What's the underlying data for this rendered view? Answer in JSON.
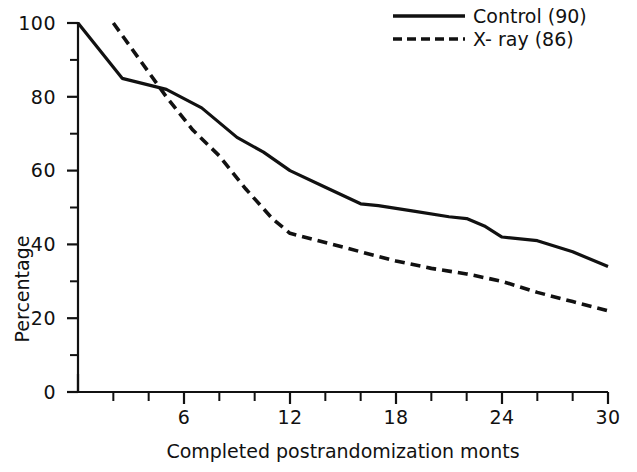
{
  "chart_data": {
    "type": "line",
    "title": "",
    "xlabel": "Completed postrandomization monts",
    "ylabel": "Percentage",
    "xlim": [
      0,
      30
    ],
    "ylim": [
      0,
      100
    ],
    "grid": false,
    "legend_position": "top-right",
    "x_ticks": [
      0,
      2,
      4,
      6,
      8,
      10,
      12,
      14,
      16,
      18,
      20,
      22,
      24,
      26,
      28,
      30
    ],
    "x_tick_labels": [
      "",
      "",
      "",
      "6",
      "",
      "",
      "12",
      "",
      "",
      "18",
      "",
      "",
      "24",
      "",
      "",
      "30"
    ],
    "x_major_ticks": [
      6,
      12,
      18,
      24,
      30
    ],
    "y_ticks": [
      0,
      10,
      20,
      30,
      40,
      50,
      60,
      70,
      80,
      90,
      100
    ],
    "y_tick_labels": [
      "0",
      "",
      "20",
      "",
      "40",
      "",
      "60",
      "",
      "80",
      "",
      "100"
    ],
    "y_major_ticks": [
      0,
      20,
      40,
      60,
      80,
      100
    ],
    "series": [
      {
        "name": "Control (90)",
        "style": "solid",
        "color": "#111111",
        "x": [
          0,
          2.5,
          5,
          7,
          9,
          10.5,
          12,
          14,
          16,
          17,
          19,
          21,
          22,
          23,
          24,
          26,
          28,
          30
        ],
        "values": [
          100,
          85,
          82,
          77,
          69,
          65,
          60,
          55.5,
          51,
          50.5,
          49,
          47.5,
          47,
          45,
          42,
          41,
          38,
          34
        ]
      },
      {
        "name": "X- ray (86)",
        "style": "dashed",
        "color": "#111111",
        "x": [
          2,
          3.5,
          5,
          6.5,
          8,
          9.5,
          11,
          12,
          14,
          16,
          18,
          20,
          22,
          24,
          26,
          28,
          30
        ],
        "values": [
          100,
          90,
          80,
          71,
          64,
          55,
          47,
          43,
          40.5,
          38,
          35.5,
          33.5,
          32,
          30,
          27,
          24.5,
          22
        ]
      }
    ]
  },
  "legend": {
    "items": [
      {
        "label": "Control (90)",
        "style": "solid"
      },
      {
        "label": "X- ray (86)",
        "style": "dashed"
      }
    ]
  },
  "axes": {
    "y_title": "Percentage",
    "x_title": "Completed postrandomization monts",
    "y_labels": [
      "100",
      "80",
      "60",
      "40",
      "20",
      "0"
    ],
    "x_labels": [
      "6",
      "12",
      "18",
      "24",
      "30"
    ]
  },
  "footer": {
    "cut_off_text": ""
  }
}
